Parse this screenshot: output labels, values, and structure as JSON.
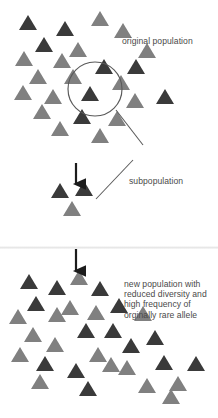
{
  "diagram": {
    "colors": {
      "dark_allele": "#3a3a3a",
      "gray_allele": "#808080",
      "text": "#4a4a4a",
      "line": "#595959",
      "background": "#ffffff",
      "divider": "#e4e4e4"
    },
    "triangle_size": {
      "half_width": 9.5,
      "height": 15
    }
  },
  "labels": {
    "original_population": "original population",
    "subpopulation": "subpopulation",
    "new_population": "new population with\nreduced diversity and\nhigh frequency of\norginally rare allele"
  },
  "original_population": {
    "count": 24,
    "triangles": [
      {
        "x": 28,
        "y": 30,
        "tone": "dark"
      },
      {
        "x": 100,
        "y": 26,
        "tone": "gray"
      },
      {
        "x": 65,
        "y": 36,
        "tone": "dark"
      },
      {
        "x": 123,
        "y": 38,
        "tone": "gray"
      },
      {
        "x": 44,
        "y": 52,
        "tone": "dark"
      },
      {
        "x": 78,
        "y": 57,
        "tone": "gray"
      },
      {
        "x": 147,
        "y": 58,
        "tone": "gray"
      },
      {
        "x": 24,
        "y": 66,
        "tone": "gray"
      },
      {
        "x": 62,
        "y": 68,
        "tone": "gray"
      },
      {
        "x": 104,
        "y": 74,
        "tone": "dark"
      },
      {
        "x": 136,
        "y": 74,
        "tone": "dark"
      },
      {
        "x": 38,
        "y": 84,
        "tone": "gray"
      },
      {
        "x": 73,
        "y": 84,
        "tone": "gray"
      },
      {
        "x": 23,
        "y": 100,
        "tone": "gray"
      },
      {
        "x": 121,
        "y": 90,
        "tone": "gray"
      },
      {
        "x": 53,
        "y": 104,
        "tone": "gray"
      },
      {
        "x": 90,
        "y": 101,
        "tone": "dark"
      },
      {
        "x": 165,
        "y": 104,
        "tone": "dark"
      },
      {
        "x": 135,
        "y": 108,
        "tone": "gray"
      },
      {
        "x": 42,
        "y": 119,
        "tone": "gray"
      },
      {
        "x": 82,
        "y": 124,
        "tone": "dark"
      },
      {
        "x": 117,
        "y": 126,
        "tone": "gray"
      },
      {
        "x": 60,
        "y": 136,
        "tone": "gray"
      },
      {
        "x": 100,
        "y": 143,
        "tone": "gray"
      }
    ]
  },
  "circle": {
    "cx": 95,
    "cy": 89,
    "r": 27
  },
  "subpopulation_group": {
    "count": 3,
    "triangles": [
      {
        "x": 60,
        "y": 198,
        "tone": "dark"
      },
      {
        "x": 84,
        "y": 196,
        "tone": "dark"
      },
      {
        "x": 72,
        "y": 216,
        "tone": "gray"
      }
    ]
  },
  "arrows": [
    {
      "name": "arrow-to-subpopulation",
      "x": 76,
      "y1": 163,
      "y2": 190
    },
    {
      "name": "arrow-to-new-population",
      "x": 76,
      "y1": 249,
      "y2": 277
    }
  ],
  "leader_lines": [
    {
      "name": "leader-circle-to-label",
      "x1": 116,
      "y1": 110,
      "x2": 143,
      "y2": 145
    },
    {
      "name": "leader-group-to-label",
      "x1": 96,
      "y1": 199,
      "x2": 133,
      "y2": 160
    }
  ],
  "divider": {
    "y": 246
  },
  "new_population": {
    "count": 30,
    "triangles": [
      {
        "x": 29,
        "y": 289,
        "tone": "dark"
      },
      {
        "x": 79,
        "y": 285,
        "tone": "gray"
      },
      {
        "x": 57,
        "y": 295,
        "tone": "dark"
      },
      {
        "x": 100,
        "y": 296,
        "tone": "dark"
      },
      {
        "x": 36,
        "y": 311,
        "tone": "dark"
      },
      {
        "x": 70,
        "y": 315,
        "tone": "gray"
      },
      {
        "x": 119,
        "y": 313,
        "tone": "dark"
      },
      {
        "x": 18,
        "y": 324,
        "tone": "gray"
      },
      {
        "x": 57,
        "y": 322,
        "tone": "gray"
      },
      {
        "x": 96,
        "y": 320,
        "tone": "gray"
      },
      {
        "x": 143,
        "y": 321,
        "tone": "gray"
      },
      {
        "x": 33,
        "y": 342,
        "tone": "gray"
      },
      {
        "x": 86,
        "y": 338,
        "tone": "dark"
      },
      {
        "x": 113,
        "y": 338,
        "tone": "dark"
      },
      {
        "x": 55,
        "y": 352,
        "tone": "gray"
      },
      {
        "x": 131,
        "y": 353,
        "tone": "dark"
      },
      {
        "x": 20,
        "y": 362,
        "tone": "gray"
      },
      {
        "x": 98,
        "y": 362,
        "tone": "gray"
      },
      {
        "x": 45,
        "y": 371,
        "tone": "dark"
      },
      {
        "x": 76,
        "y": 378,
        "tone": "dark"
      },
      {
        "x": 127,
        "y": 375,
        "tone": "gray"
      },
      {
        "x": 164,
        "y": 370,
        "tone": "dark"
      },
      {
        "x": 40,
        "y": 389,
        "tone": "gray"
      },
      {
        "x": 88,
        "y": 396,
        "tone": "dark"
      },
      {
        "x": 111,
        "y": 372,
        "tone": "gray"
      },
      {
        "x": 155,
        "y": 345,
        "tone": "dark"
      },
      {
        "x": 147,
        "y": 393,
        "tone": "gray"
      },
      {
        "x": 178,
        "y": 391,
        "tone": "gray"
      },
      {
        "x": 196,
        "y": 371,
        "tone": "dark"
      },
      {
        "x": 171,
        "y": 404,
        "tone": "gray"
      }
    ]
  }
}
